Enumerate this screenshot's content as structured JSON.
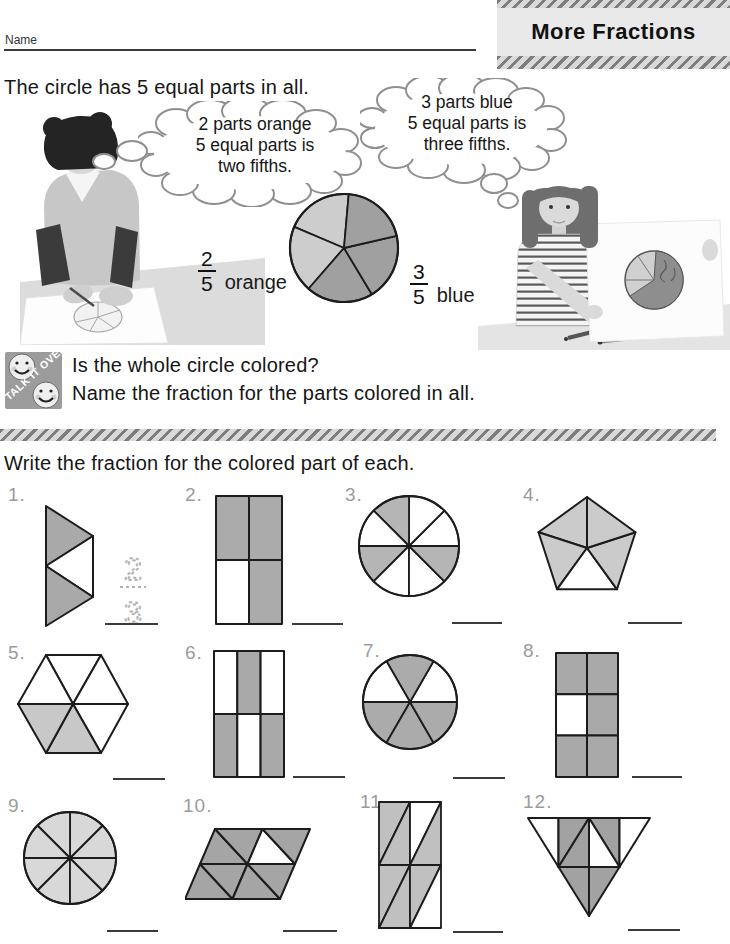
{
  "page": {
    "name_label": "Name",
    "title": "More Fractions",
    "intro": "The circle has 5 equal parts in all.",
    "instruction": "Write the fraction for the colored part of each."
  },
  "thought_bubbles": {
    "left": {
      "line1": "2 parts orange",
      "line2": "5 equal parts is",
      "line3": "two fifths."
    },
    "right": {
      "line1": "3 parts blue",
      "line2": "5 equal parts is",
      "line3": "three fifths."
    }
  },
  "example": {
    "pie": {
      "total_parts": 5,
      "orange_parts": 2,
      "blue_parts": 3
    },
    "orange_fraction": {
      "numerator": "2",
      "denominator": "5",
      "label": "orange"
    },
    "blue_fraction": {
      "numerator": "3",
      "denominator": "5",
      "label": "blue"
    }
  },
  "talk_it_over": {
    "icon_label": "TALK IT OVER",
    "question1": "Is the whole circle colored?",
    "question2": "Name the fraction for the parts colored in all."
  },
  "exercises": [
    {
      "number": "1.",
      "shape": "triangle-fan",
      "total_parts": 3,
      "shaded_parts": 2,
      "traced_answer": {
        "numerator": "2",
        "denominator": "3"
      }
    },
    {
      "number": "2.",
      "shape": "rectangle-2x2",
      "total_parts": 4,
      "shaded_parts": 3
    },
    {
      "number": "3.",
      "shape": "circle-8-sectors",
      "total_parts": 8,
      "shaded_parts": 3
    },
    {
      "number": "4.",
      "shape": "pentagon-5-triangles",
      "total_parts": 5,
      "shaded_parts": 4
    },
    {
      "number": "5.",
      "shape": "hexagon-6-triangles",
      "total_parts": 6,
      "shaded_parts": 2
    },
    {
      "number": "6.",
      "shape": "rectangle-3x2",
      "total_parts": 6,
      "shaded_parts": 3
    },
    {
      "number": "7.",
      "shape": "circle-6-sectors",
      "total_parts": 6,
      "shaded_parts": 4
    },
    {
      "number": "8.",
      "shape": "rectangle-2x3",
      "total_parts": 6,
      "shaded_parts": 5
    },
    {
      "number": "9.",
      "shape": "circle-8-sectors",
      "total_parts": 8,
      "shaded_parts": 8
    },
    {
      "number": "10.",
      "shape": "parallelogram-8-triangles",
      "total_parts": 8,
      "shaded_parts": 7
    },
    {
      "number": "11.",
      "shape": "rectangle-8-triangles",
      "total_parts": 8,
      "shaded_parts": 6
    },
    {
      "number": "12.",
      "shape": "triangle-8-triangles",
      "total_parts": 8,
      "shaded_parts": 5
    }
  ],
  "colors": {
    "shade_medium": "#a9a9a9",
    "shade_light": "#c9c9c9",
    "shade_pale": "#d8d8d8",
    "pie_orange_gray": "#cdcdcd",
    "pie_blue_gray": "#a0a0a0",
    "stripe_dark": "#7d7d7d",
    "stripe_light": "#d9d9d9"
  }
}
